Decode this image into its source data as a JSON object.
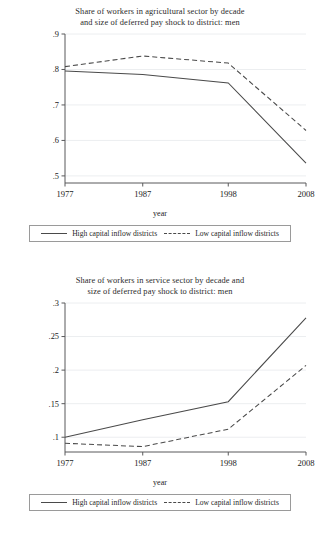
{
  "figure": {
    "panels": [
      {
        "title_line1": "Share of workers in agricultural sector by decade",
        "title_line2": "and size of deferred pay shock to district: men",
        "xlabel": "year",
        "legend": {
          "series1": "High capital inflow districts",
          "series2": "Low capital inflow districts"
        }
      },
      {
        "title_line1": "Share of workers in service sector by decade and",
        "title_line2": "size of deferred pay shock to district: men",
        "xlabel": "year",
        "legend": {
          "series1": "High capital inflow districts",
          "series2": "Low capital inflow districts"
        }
      }
    ]
  },
  "chart_data": [
    {
      "type": "line",
      "title": "Share of workers in agricultural sector by decade and size of deferred pay shock to district: men",
      "xlabel": "year",
      "ylabel": "",
      "x": [
        1977,
        1987,
        1998,
        2008
      ],
      "xticklabels": [
        "1977",
        "1987",
        "1998",
        "2008"
      ],
      "yticks": [
        0.5,
        0.6,
        0.7,
        0.8,
        0.9
      ],
      "yticklabels": [
        ".5",
        ".6",
        ".7",
        ".8",
        ".9"
      ],
      "ylim": [
        0.48,
        0.9
      ],
      "xlim": [
        1977,
        2008
      ],
      "grid": "horizontal",
      "legend_position": "below",
      "series": [
        {
          "name": "High capital inflow districts",
          "style": "solid",
          "color": "#4a4a4a",
          "values": [
            0.796,
            0.786,
            0.762,
            0.536
          ]
        },
        {
          "name": "Low capital inflow districts",
          "style": "dashed",
          "color": "#4a4a4a",
          "values": [
            0.808,
            0.838,
            0.818,
            0.628
          ]
        }
      ]
    },
    {
      "type": "line",
      "title": "Share of workers in service sector by decade and size of deferred pay shock to district: men",
      "xlabel": "year",
      "ylabel": "",
      "x": [
        1977,
        1987,
        1998,
        2008
      ],
      "xticklabels": [
        "1977",
        "1987",
        "1998",
        "2008"
      ],
      "yticks": [
        0.1,
        0.15,
        0.2,
        0.25,
        0.3
      ],
      "yticklabels": [
        ".1",
        ".15",
        ".2",
        ".25",
        ".3"
      ],
      "ylim": [
        0.078,
        0.3
      ],
      "xlim": [
        1977,
        2008
      ],
      "grid": "horizontal",
      "legend_position": "below",
      "series": [
        {
          "name": "High capital inflow districts",
          "style": "solid",
          "color": "#4a4a4a",
          "values": [
            0.1,
            0.126,
            0.153,
            0.278
          ]
        },
        {
          "name": "Low capital inflow districts",
          "style": "dashed",
          "color": "#4a4a4a",
          "values": [
            0.091,
            0.086,
            0.112,
            0.207
          ]
        }
      ]
    }
  ]
}
